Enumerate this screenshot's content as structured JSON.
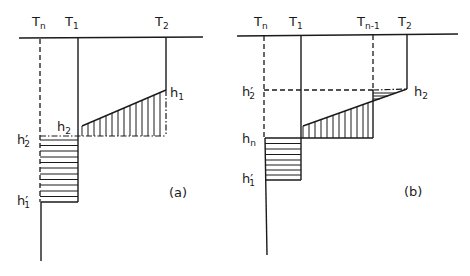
{
  "figure": {
    "panel_a": {
      "caption": "(a)",
      "columns": [
        {
          "id": "Tn",
          "base": "T",
          "sub": "n",
          "x": 40,
          "style": "dashed"
        },
        {
          "id": "T1",
          "base": "T",
          "sub": "1",
          "x": 78,
          "style": "solid"
        },
        {
          "id": "T2",
          "base": "T",
          "sub": "2",
          "x": 166,
          "style": "solid"
        }
      ],
      "levels": {
        "h1": {
          "base": "h",
          "sub": "1",
          "y": 90
        },
        "h2": {
          "base": "h",
          "sub": "2",
          "y": 136
        },
        "h2_prime": {
          "base": "h",
          "sub": "2",
          "prime": "′",
          "y": 136
        },
        "h1_prime": {
          "base": "h",
          "sub": "1",
          "prime": "′",
          "y": 202
        }
      }
    },
    "panel_b": {
      "caption": "(b)",
      "columns": [
        {
          "id": "Tn",
          "base": "T",
          "sub": "n",
          "x": 264,
          "style": "dashed"
        },
        {
          "id": "T1",
          "base": "T",
          "sub": "1",
          "x": 301,
          "style": "solid"
        },
        {
          "id": "Tn-1",
          "base": "T",
          "sub": "n-1",
          "x": 373,
          "style": "dashed"
        },
        {
          "id": "T2",
          "base": "T",
          "sub": "2",
          "x": 407,
          "style": "solid"
        }
      ],
      "levels": {
        "h2": {
          "base": "h",
          "sub": "2",
          "y": 89
        },
        "h2_prime": {
          "base": "h",
          "sub": "2",
          "prime": "′",
          "y": 90
        },
        "hn": {
          "base": "h",
          "sub": "n",
          "y": 138
        },
        "h1_prime": {
          "base": "h",
          "sub": "1",
          "prime": "′",
          "y": 180
        }
      }
    }
  },
  "labels": {
    "a_Tn": "T",
    "a_Tn_sub": "n",
    "a_T1": "T",
    "a_T1_sub": "1",
    "a_T2": "T",
    "a_T2_sub": "2",
    "a_h1": "h",
    "a_h1_sub": "1",
    "a_h2": "h",
    "a_h2_sub": "2",
    "a_h2p": "h′",
    "a_h2p_sub": "2",
    "a_h1p": "h′",
    "a_h1p_sub": "1",
    "a_caption": "(a)",
    "b_Tn": "T",
    "b_Tn_sub": "n",
    "b_T1": "T",
    "b_T1_sub": "1",
    "b_Tn1": "T",
    "b_Tn1_sub": "n-1",
    "b_T2": "T",
    "b_T2_sub": "2",
    "b_h2": "h",
    "b_h2_sub": "2",
    "b_h2p": "h′",
    "b_h2p_sub": "2",
    "b_hn": "h",
    "b_hn_sub": "n",
    "b_h1p": "h′",
    "b_h1p_sub": "1",
    "b_caption": "(b)"
  }
}
